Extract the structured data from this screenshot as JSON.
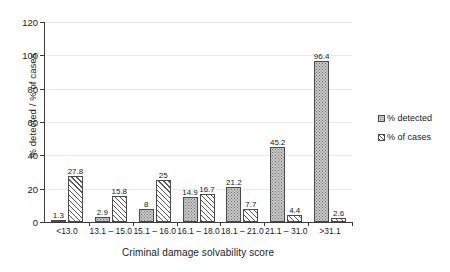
{
  "chart_data": {
    "type": "bar",
    "title": "",
    "subtitle": "",
    "xlabel": "Criminal damage solvability score",
    "ylabel": "% detected / % of cases",
    "ylim": [
      0,
      120
    ],
    "ytick_step": 20,
    "yticks": [
      "0",
      "20",
      "40",
      "60",
      "80",
      "100",
      "120"
    ],
    "grid": true,
    "legend_position": "right",
    "categories": [
      "<13.0",
      "13.1 – 15.0",
      "15.1 – 16.0",
      "16.1 – 18.0",
      "18.1 – 21.0",
      "21.1 – 31.0",
      ">31.1"
    ],
    "series": [
      {
        "name": "% detected",
        "fill": "dotted",
        "color": "#c9c9c9",
        "values": [
          1.3,
          2.9,
          8,
          14.9,
          21.2,
          45.2,
          96.4
        ],
        "labels": [
          "1.3",
          "2.9",
          "8",
          "14.9",
          "21.2",
          "45.2",
          "96.4"
        ]
      },
      {
        "name": "% of cases",
        "fill": "diagonal-hatch",
        "color": "#ffffff",
        "values": [
          27.8,
          15.8,
          25,
          16.7,
          7.7,
          4.4,
          2.6
        ],
        "labels": [
          "27.8",
          "15.8",
          "25",
          "16.7",
          "7.7",
          "4.4",
          "2.6"
        ]
      }
    ]
  },
  "legend": {
    "items": [
      {
        "label": "% detected"
      },
      {
        "label": "% of cases"
      }
    ]
  }
}
